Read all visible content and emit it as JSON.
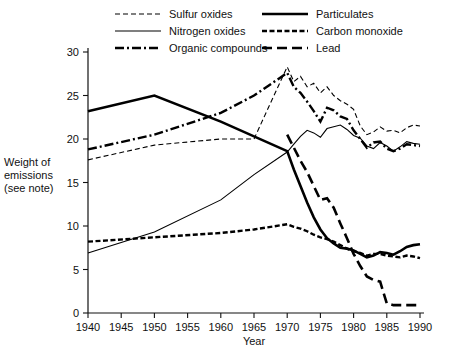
{
  "chart_data": {
    "type": "line",
    "title": "",
    "xlabel": "Year",
    "ylabel": "Weight of emissions (see note)",
    "ylabel_lines": [
      "Weight of",
      "emissions",
      "(see note)"
    ],
    "xlim": [
      1940,
      1990
    ],
    "ylim": [
      0,
      30
    ],
    "xticks": [
      1940,
      1945,
      1950,
      1955,
      1960,
      1965,
      1970,
      1975,
      1980,
      1985,
      1990
    ],
    "yticks": [
      0,
      5,
      10,
      15,
      20,
      25,
      30
    ],
    "grid": false,
    "legend_position": "top",
    "series": [
      {
        "name": "Sulfur oxides",
        "style": "dashed",
        "stroke_width": 1.1,
        "dash": "5,3",
        "x": [
          1940,
          1950,
          1960,
          1965,
          1970,
          1971,
          1972,
          1973,
          1974,
          1975,
          1976,
          1977,
          1978,
          1979,
          1980,
          1981,
          1982,
          1983,
          1984,
          1985,
          1986,
          1987,
          1988,
          1989,
          1990
        ],
        "y": [
          17.6,
          19.3,
          20.0,
          20.0,
          28.3,
          26.6,
          27.2,
          26.0,
          26.4,
          25.3,
          26.0,
          25.0,
          24.4,
          24.0,
          23.4,
          21.5,
          20.5,
          20.8,
          21.4,
          20.9,
          21.0,
          20.7,
          21.3,
          21.6,
          21.5
        ]
      },
      {
        "name": "Nitrogen oxides",
        "style": "solid-thin",
        "stroke_width": 1.1,
        "dash": "",
        "x": [
          1940,
          1950,
          1960,
          1965,
          1970,
          1971,
          1972,
          1973,
          1974,
          1975,
          1976,
          1977,
          1978,
          1979,
          1980,
          1981,
          1982,
          1983,
          1984,
          1985,
          1986,
          1987,
          1988,
          1989,
          1990
        ],
        "y": [
          6.9,
          9.3,
          13.0,
          15.9,
          18.5,
          19.4,
          20.3,
          21.0,
          20.7,
          20.2,
          21.2,
          21.4,
          21.6,
          21.1,
          20.4,
          20.1,
          19.2,
          18.9,
          19.6,
          19.2,
          18.6,
          19.1,
          19.7,
          19.5,
          19.4
        ]
      },
      {
        "name": "Organic compounds",
        "style": "dash-dot",
        "stroke_width": 2.4,
        "dash": "9,3,2,3",
        "x": [
          1940,
          1950,
          1960,
          1965,
          1970,
          1971,
          1972,
          1973,
          1974,
          1975,
          1976,
          1977,
          1978,
          1979,
          1980,
          1981,
          1982,
          1983,
          1984,
          1985,
          1986,
          1987,
          1988,
          1989,
          1990
        ],
        "y": [
          18.8,
          20.5,
          23.0,
          25.0,
          27.6,
          26.0,
          25.3,
          24.3,
          23.2,
          22.0,
          23.6,
          23.3,
          22.6,
          22.3,
          21.0,
          20.0,
          19.0,
          19.6,
          19.7,
          18.9,
          18.6,
          18.9,
          19.4,
          19.3,
          19.2
        ]
      },
      {
        "name": "Particulates",
        "style": "solid-thick",
        "stroke_width": 2.6,
        "dash": "",
        "x": [
          1940,
          1950,
          1960,
          1970,
          1971,
          1972,
          1973,
          1974,
          1975,
          1976,
          1977,
          1978,
          1979,
          1980,
          1981,
          1982,
          1983,
          1984,
          1985,
          1986,
          1987,
          1988,
          1989,
          1990
        ],
        "y": [
          23.2,
          25.0,
          22.0,
          18.6,
          16.5,
          14.6,
          12.7,
          11.0,
          9.6,
          8.6,
          8.0,
          7.5,
          7.4,
          7.2,
          6.8,
          6.4,
          6.6,
          7.0,
          6.9,
          6.7,
          7.1,
          7.6,
          7.8,
          7.9
        ]
      },
      {
        "name": "Carbon monoxide",
        "style": "dashed-thick",
        "stroke_width": 2.4,
        "dash": "5,2.5",
        "x": [
          1940,
          1950,
          1960,
          1965,
          1970,
          1971,
          1972,
          1973,
          1974,
          1975,
          1976,
          1977,
          1978,
          1979,
          1980,
          1981,
          1982,
          1983,
          1984,
          1985,
          1986,
          1987,
          1988,
          1989,
          1990
        ],
        "y": [
          8.2,
          8.7,
          9.2,
          9.6,
          10.2,
          9.9,
          9.7,
          9.4,
          9.0,
          8.7,
          8.5,
          8.2,
          7.8,
          7.4,
          7.1,
          6.9,
          6.6,
          6.8,
          6.8,
          6.6,
          6.5,
          6.4,
          6.6,
          6.5,
          6.3
        ]
      },
      {
        "name": "Lead",
        "style": "long-dash",
        "stroke_width": 2.6,
        "dash": "10,5",
        "x": [
          1970,
          1971,
          1972,
          1973,
          1974,
          1975,
          1976,
          1977,
          1978,
          1979,
          1980,
          1981,
          1982,
          1983,
          1984,
          1985,
          1986,
          1987,
          1988,
          1989,
          1990
        ],
        "y": [
          20.5,
          19.0,
          17.5,
          16.2,
          14.6,
          13.0,
          13.2,
          12.1,
          10.3,
          8.6,
          6.8,
          5.4,
          4.2,
          3.8,
          3.6,
          1.1,
          0.9,
          0.9,
          0.9,
          0.9,
          0.9
        ]
      }
    ],
    "legend": [
      {
        "label": "Sulfur oxides",
        "style": "dashed",
        "column": 0,
        "row": 0
      },
      {
        "label": "Nitrogen oxides",
        "style": "solid-thin",
        "column": 0,
        "row": 1
      },
      {
        "label": "Organic compounds",
        "style": "dash-dot",
        "column": 0,
        "row": 2
      },
      {
        "label": "Particulates",
        "style": "solid-thick",
        "column": 1,
        "row": 0
      },
      {
        "label": "Carbon monoxide",
        "style": "dashed-thick",
        "column": 1,
        "row": 1
      },
      {
        "label": "Lead",
        "style": "long-dash",
        "column": 1,
        "row": 2
      }
    ]
  },
  "colors": {
    "ink": "#111111",
    "background": "#ffffff"
  }
}
